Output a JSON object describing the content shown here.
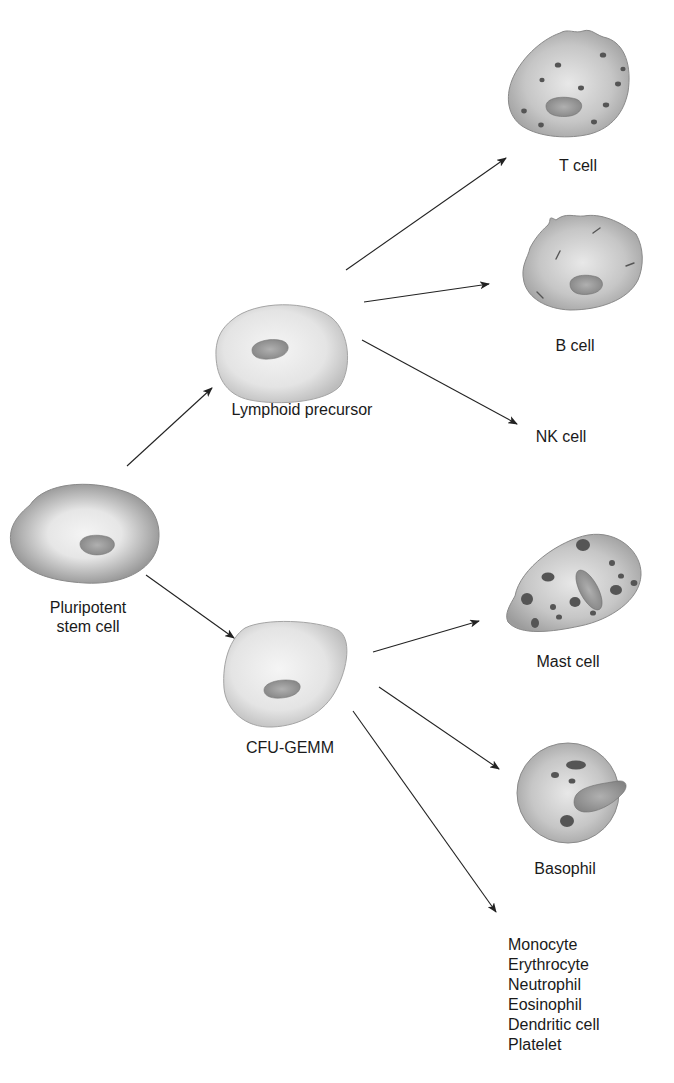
{
  "diagram": {
    "colors": {
      "background": "#ffffff",
      "cell_edge": "#8a8a8a",
      "cell_light": "#f2f2f2",
      "cell_mid": "#c9c9c9",
      "cell_dark": "#9a9a9a",
      "nucleus": "#8f8f8f",
      "granule": "#555555",
      "arrow": "#222222",
      "text": "#1a1a1a"
    },
    "nodes": {
      "stem": {
        "label_line1": "Pluripotent",
        "label_line2": "stem cell"
      },
      "lymphoid": {
        "label": "Lymphoid precursor"
      },
      "cfu": {
        "label": "CFU-GEMM"
      },
      "t_cell": {
        "label": "T cell"
      },
      "b_cell": {
        "label": "B cell"
      },
      "nk_cell": {
        "label": "NK cell"
      },
      "mast_cell": {
        "label": "Mast cell"
      },
      "basophil": {
        "label": "Basophil"
      },
      "other_myeloid": {
        "items": [
          "Monocyte",
          "Erythrocyte",
          "Neutrophil",
          "Eosinophil",
          "Dendritic cell",
          "Platelet"
        ]
      }
    },
    "edges": [
      {
        "from": "Pluripotent stem cell",
        "to": "Lymphoid precursor"
      },
      {
        "from": "Pluripotent stem cell",
        "to": "CFU-GEMM"
      },
      {
        "from": "Lymphoid precursor",
        "to": "T cell"
      },
      {
        "from": "Lymphoid precursor",
        "to": "B cell"
      },
      {
        "from": "Lymphoid precursor",
        "to": "NK cell"
      },
      {
        "from": "CFU-GEMM",
        "to": "Mast cell"
      },
      {
        "from": "CFU-GEMM",
        "to": "Basophil"
      },
      {
        "from": "CFU-GEMM",
        "to": "Monocyte / Erythrocyte / Neutrophil / Eosinophil / Dendritic cell / Platelet"
      }
    ]
  }
}
